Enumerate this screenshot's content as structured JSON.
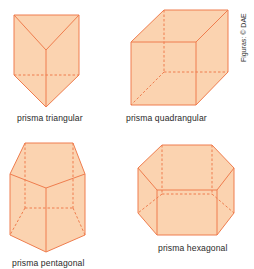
{
  "figure": {
    "credit": "Figuras: © DAE",
    "colors": {
      "fill": "#fbd3b0",
      "stroke": "#ef7d4e",
      "text": "#2a2a2a"
    },
    "prisms": [
      {
        "id": "triangular",
        "label": "prisma triangular"
      },
      {
        "id": "quadrangular",
        "label": "prisma quadrangular"
      },
      {
        "id": "pentagonal",
        "label": "prisma pentagonal"
      },
      {
        "id": "hexagonal",
        "label": "prisma hexagonal"
      }
    ]
  }
}
